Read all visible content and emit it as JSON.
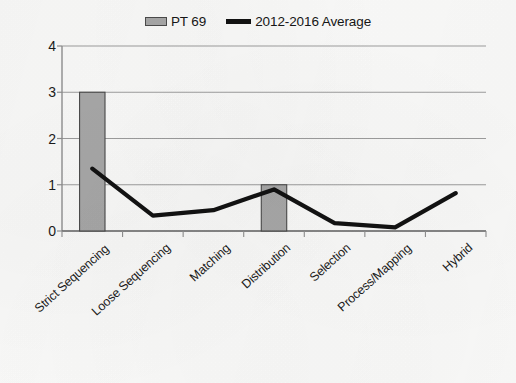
{
  "legend": {
    "position": "top-center",
    "entries": [
      {
        "label": "PT 69",
        "kind": "bar",
        "color": "#a8a8a8",
        "border": "#4a4a4a"
      },
      {
        "label": "2012-2016 Average",
        "kind": "line",
        "color": "#121212"
      }
    ]
  },
  "axis": {
    "y_ticks": [
      "4",
      "3",
      "2",
      "1",
      "0"
    ],
    "x_labels": [
      "Strict Sequencing",
      "Loose Sequencing",
      "Matching",
      "Distribution",
      "Selection",
      "Process/Mapping",
      "Hybrid"
    ]
  },
  "colors": {
    "bar_fill": "#a8a8a8",
    "bar_stroke": "#4a4a4a",
    "line": "#121212",
    "gridline": "#9d9d9d",
    "axis": "#8f8f8f",
    "text": "#1b1b1b",
    "background": "#fbfbfa"
  },
  "chart_data": {
    "type": "bar",
    "title": "",
    "subtitle": "",
    "xlabel": "",
    "ylabel": "",
    "ylim": [
      0,
      4
    ],
    "yticks": [
      0,
      1,
      2,
      3,
      4
    ],
    "grid": true,
    "legend_position": "top-center",
    "categories": [
      "Strict Sequencing",
      "Loose Sequencing",
      "Matching",
      "Distribution",
      "Selection",
      "Process/Mapping",
      "Hybrid"
    ],
    "series": [
      {
        "name": "PT 69",
        "type": "bar",
        "color": "#a8a8a8",
        "values": [
          3,
          0,
          0,
          1,
          0,
          0,
          0
        ]
      },
      {
        "name": "2012-2016 Average",
        "type": "line",
        "color": "#121212",
        "values": [
          1.35,
          0.33,
          0.45,
          0.9,
          0.17,
          0.08,
          0.82
        ]
      }
    ]
  }
}
